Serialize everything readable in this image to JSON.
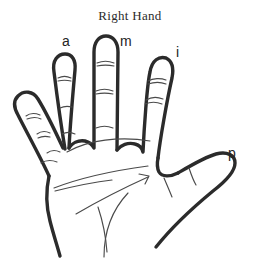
{
  "figure": {
    "title": "Right Hand",
    "background_color": "#ffffff",
    "ink_color": "#2b2b2b",
    "width": 260,
    "height": 268
  },
  "labels": [
    {
      "id": "a",
      "text": "a",
      "meaning": "anular / ring finger",
      "x": 62,
      "y": 34
    },
    {
      "id": "m",
      "text": "m",
      "meaning": "medio / middle finger",
      "x": 120,
      "y": 34
    },
    {
      "id": "i",
      "text": "i",
      "meaning": "indice / index finger",
      "x": 176,
      "y": 45
    },
    {
      "id": "p",
      "text": "p",
      "meaning": "pulgar / thumb",
      "x": 228,
      "y": 146
    }
  ],
  "drawing": {
    "stroke_color": "#2b2b2b",
    "outline_width": 3.4,
    "crease_color": "#4a4a4a",
    "crease_width": 1.1,
    "parts": [
      "pinky-finger",
      "ring-finger",
      "middle-finger",
      "index-finger",
      "thumb",
      "palm",
      "palm-creases",
      "knuckle-creases"
    ]
  }
}
